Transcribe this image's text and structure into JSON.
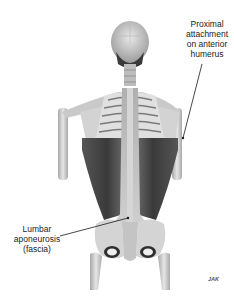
{
  "figure": {
    "colors": {
      "bone": "#d8d8d8",
      "bone_shadow": "#9a9a9a",
      "muscle": "#4a4a4a",
      "muscle_dark": "#2e2e2e",
      "fascia": "#bdbdbd",
      "leader_line": "#1a1a1a",
      "background": "#ffffff"
    }
  },
  "labels": {
    "top": {
      "lines": [
        "Proximal",
        "attachment",
        "on anterior",
        "humerus"
      ]
    },
    "bottom": {
      "lines": [
        "Lumbar",
        "aponeurosis",
        "(fascia)"
      ]
    }
  },
  "signature": "JAK"
}
